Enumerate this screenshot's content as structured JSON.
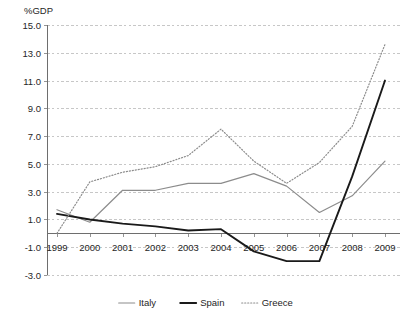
{
  "chart_data": {
    "type": "line",
    "title": "",
    "ylabel": "%GDP",
    "xlabel": "",
    "grid": true,
    "legend_position": "bottom",
    "ylim": [
      -3.0,
      15.0
    ],
    "ytick_step": 2.0,
    "ytick_labels": [
      "15.0",
      "13.0",
      "11.0",
      "9.0",
      "7.0",
      "5.0",
      "3.0",
      "1.0",
      "-1.0",
      "-3.0"
    ],
    "ytick_values": [
      15.0,
      13.0,
      11.0,
      9.0,
      7.0,
      5.0,
      3.0,
      1.0,
      -1.0,
      -3.0
    ],
    "categories": [
      "1999",
      "2000",
      "2001",
      "2002",
      "2003",
      "2004",
      "2005",
      "2006",
      "2007",
      "2008",
      "2009"
    ],
    "x": [
      1999,
      2000,
      2001,
      2002,
      2003,
      2004,
      2005,
      2006,
      2007,
      2008,
      2009
    ],
    "series": [
      {
        "name": "Italy",
        "color": "#8c8c8c",
        "style": "solid",
        "width": 1.2,
        "values": [
          1.7,
          0.8,
          3.1,
          3.1,
          3.6,
          3.6,
          4.3,
          3.4,
          1.5,
          2.7,
          5.2
        ]
      },
      {
        "name": "Spain",
        "color": "#1a1a1a",
        "style": "solid",
        "width": 1.9,
        "values": [
          1.4,
          1.0,
          0.7,
          0.5,
          0.2,
          0.3,
          -1.3,
          -2.0,
          -2.0,
          4.1,
          11.0
        ]
      },
      {
        "name": "Greece",
        "color": "#8c8c8c",
        "style": "dotted",
        "width": 1.2,
        "values": [
          0.0,
          3.7,
          4.4,
          4.8,
          5.6,
          7.5,
          5.2,
          3.6,
          5.1,
          7.7,
          13.6
        ]
      }
    ]
  },
  "legend": {
    "items": [
      {
        "label": "Italy"
      },
      {
        "label": "Spain"
      },
      {
        "label": "Greece"
      }
    ]
  }
}
